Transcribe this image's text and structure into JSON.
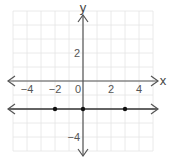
{
  "chart_data": {
    "type": "line",
    "title": "",
    "xlabel": "x",
    "ylabel": "y",
    "xlim": [
      -5,
      5
    ],
    "ylim": [
      -5,
      5
    ],
    "grid": true,
    "x_ticks": [
      "−4",
      "−2",
      "0",
      "2",
      "4"
    ],
    "y_ticks": [
      "2",
      "−4"
    ],
    "series": [
      {
        "name": "y = -2",
        "equation": "y = -2",
        "style": "line with arrows both ends",
        "points": [
          {
            "x": -2,
            "y": -2
          },
          {
            "x": 0,
            "y": -2
          },
          {
            "x": 3,
            "y": -2
          }
        ]
      }
    ]
  },
  "colors": {
    "grid": "#e4e4e4",
    "axis": "#555555",
    "line": "#333333",
    "point": "#111111"
  }
}
